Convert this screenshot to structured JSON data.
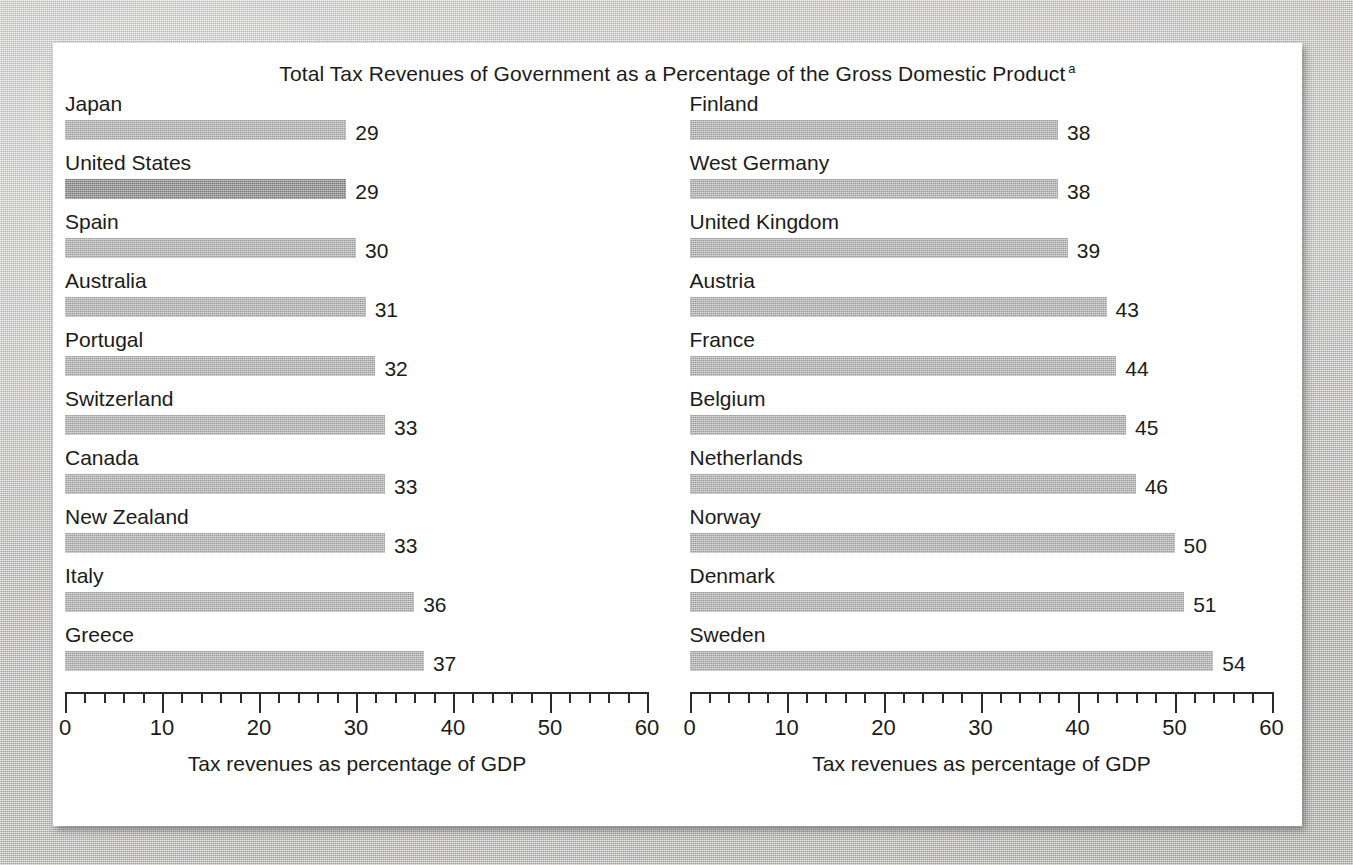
{
  "chart_data": {
    "type": "bar",
    "title": "Total Tax Revenues of Government as a Percentage of the Gross Domestic Product",
    "title_superscript": "a",
    "orientation": "horizontal",
    "xlabel": "Tax revenues as percentage of GDP",
    "ylabel": "",
    "xlim": [
      0,
      60
    ],
    "grid": false,
    "legend": false,
    "major_tick_step": 10,
    "minor_tick_step": 2,
    "tick_labels": [
      "0",
      "10",
      "20",
      "30",
      "40",
      "50",
      "60"
    ],
    "tick_values": [
      0,
      10,
      20,
      30,
      40,
      50,
      60
    ],
    "bar_color": "#b4b4b4",
    "highlight_color": "#8b8b8b",
    "highlighted_category": "United States",
    "categories": [
      "Japan",
      "United States",
      "Spain",
      "Australia",
      "Portugal",
      "Switzerland",
      "Canada",
      "New Zealand",
      "Italy",
      "Greece",
      "Finland",
      "West Germany",
      "United Kingdom",
      "Austria",
      "France",
      "Belgium",
      "Netherlands",
      "Norway",
      "Denmark",
      "Sweden"
    ],
    "values": [
      29,
      29,
      30,
      31,
      32,
      33,
      33,
      33,
      36,
      37,
      38,
      38,
      39,
      43,
      44,
      45,
      46,
      50,
      51,
      54
    ]
  },
  "panels": [
    {
      "axis_title": "Tax revenues as percentage of GDP",
      "tick_labels": [
        "0",
        "10",
        "20",
        "30",
        "40",
        "50",
        "60"
      ],
      "rows": [
        {
          "label": "Japan",
          "value": 29,
          "value_text": "29",
          "highlight": false
        },
        {
          "label": "United States",
          "value": 29,
          "value_text": "29",
          "highlight": true
        },
        {
          "label": "Spain",
          "value": 30,
          "value_text": "30",
          "highlight": false
        },
        {
          "label": "Australia",
          "value": 31,
          "value_text": "31",
          "highlight": false
        },
        {
          "label": "Portugal",
          "value": 32,
          "value_text": "32",
          "highlight": false
        },
        {
          "label": "Switzerland",
          "value": 33,
          "value_text": "33",
          "highlight": false
        },
        {
          "label": "Canada",
          "value": 33,
          "value_text": "33",
          "highlight": false
        },
        {
          "label": "New Zealand",
          "value": 33,
          "value_text": "33",
          "highlight": false
        },
        {
          "label": "Italy",
          "value": 36,
          "value_text": "36",
          "highlight": false
        },
        {
          "label": "Greece",
          "value": 37,
          "value_text": "37",
          "highlight": false
        }
      ]
    },
    {
      "axis_title": "Tax revenues as percentage of GDP",
      "tick_labels": [
        "0",
        "10",
        "20",
        "30",
        "40",
        "50",
        "60"
      ],
      "rows": [
        {
          "label": "Finland",
          "value": 38,
          "value_text": "38",
          "highlight": false
        },
        {
          "label": "West Germany",
          "value": 38,
          "value_text": "38",
          "highlight": false
        },
        {
          "label": "United Kingdom",
          "value": 39,
          "value_text": "39",
          "highlight": false
        },
        {
          "label": "Austria",
          "value": 43,
          "value_text": "43",
          "highlight": false
        },
        {
          "label": "France",
          "value": 44,
          "value_text": "44",
          "highlight": false
        },
        {
          "label": "Belgium",
          "value": 45,
          "value_text": "45",
          "highlight": false
        },
        {
          "label": "Netherlands",
          "value": 46,
          "value_text": "46",
          "highlight": false
        },
        {
          "label": "Norway",
          "value": 50,
          "value_text": "50",
          "highlight": false
        },
        {
          "label": "Denmark",
          "value": 51,
          "value_text": "51",
          "highlight": false
        },
        {
          "label": "Sweden",
          "value": 54,
          "value_text": "54",
          "highlight": false
        }
      ]
    }
  ]
}
